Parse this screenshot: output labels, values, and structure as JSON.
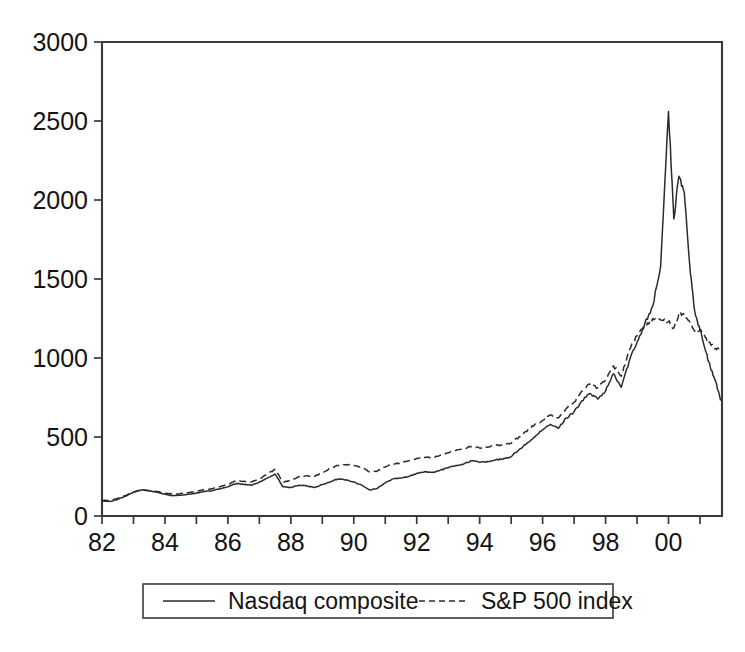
{
  "chart_data": {
    "type": "line",
    "title": "",
    "subtitle": "",
    "xlabel": "",
    "ylabel": "",
    "xlim": [
      1982.0,
      2001.7
    ],
    "ylim": [
      0,
      3000
    ],
    "grid": false,
    "legend_position": "bottom",
    "y_ticks": [
      0,
      500,
      1000,
      1500,
      2000,
      2500,
      3000
    ],
    "y_tick_labels": [
      "0",
      "500",
      "1000",
      "1500",
      "2000",
      "2500",
      "3000"
    ],
    "x_ticks": [
      1982,
      1983,
      1984,
      1985,
      1986,
      1987,
      1988,
      1989,
      1990,
      1991,
      1992,
      1993,
      1994,
      1995,
      1996,
      1997,
      1998,
      1999,
      2000,
      2001
    ],
    "x_tick_labels": [
      "82",
      "",
      "84",
      "",
      "86",
      "",
      "88",
      "",
      "90",
      "",
      "92",
      "",
      "94",
      "",
      "96",
      "",
      "98",
      "",
      "00",
      ""
    ],
    "x_labeled_ticks": [
      {
        "x": 1982,
        "label": "82"
      },
      {
        "x": 1984,
        "label": "84"
      },
      {
        "x": 1986,
        "label": "86"
      },
      {
        "x": 1988,
        "label": "88"
      },
      {
        "x": 1990,
        "label": "90"
      },
      {
        "x": 1992,
        "label": "92"
      },
      {
        "x": 1994,
        "label": "94"
      },
      {
        "x": 1996,
        "label": "96"
      },
      {
        "x": 1998,
        "label": "98"
      },
      {
        "x": 2000,
        "label": "00"
      }
    ],
    "series": [
      {
        "name": "Nasdaq composite",
        "style": "solid",
        "color": "#2b2b2b",
        "x": [
          1982.0,
          1982.25,
          1982.5,
          1982.75,
          1983.0,
          1983.25,
          1983.5,
          1983.75,
          1984.0,
          1984.25,
          1984.5,
          1984.75,
          1985.0,
          1985.25,
          1985.5,
          1985.75,
          1986.0,
          1986.25,
          1986.5,
          1986.75,
          1987.0,
          1987.25,
          1987.5,
          1987.75,
          1988.0,
          1988.25,
          1988.5,
          1988.75,
          1989.0,
          1989.25,
          1989.5,
          1989.75,
          1990.0,
          1990.25,
          1990.5,
          1990.75,
          1991.0,
          1991.25,
          1991.5,
          1991.75,
          1992.0,
          1992.25,
          1992.5,
          1992.75,
          1993.0,
          1993.25,
          1993.5,
          1993.75,
          1994.0,
          1994.25,
          1994.5,
          1994.75,
          1995.0,
          1995.25,
          1995.5,
          1995.75,
          1996.0,
          1996.25,
          1996.5,
          1996.75,
          1997.0,
          1997.25,
          1997.5,
          1997.75,
          1998.0,
          1998.25,
          1998.5,
          1998.75,
          1999.0,
          1999.25,
          1999.5,
          1999.75,
          2000.0,
          2000.17,
          2000.33,
          2000.5,
          2000.67,
          2000.83,
          2001.0,
          2001.17,
          2001.33,
          2001.5,
          2001.65
        ],
        "y": [
          95,
          92,
          105,
          125,
          150,
          165,
          160,
          150,
          138,
          128,
          132,
          138,
          145,
          155,
          160,
          172,
          185,
          205,
          200,
          195,
          215,
          240,
          265,
          185,
          180,
          195,
          190,
          180,
          200,
          215,
          235,
          230,
          215,
          195,
          165,
          175,
          210,
          235,
          240,
          250,
          270,
          280,
          275,
          290,
          305,
          320,
          330,
          350,
          340,
          345,
          355,
          360,
          375,
          420,
          460,
          500,
          545,
          580,
          555,
          620,
          660,
          730,
          775,
          740,
          790,
          900,
          815,
          980,
          1100,
          1220,
          1330,
          1580,
          2560,
          1880,
          2150,
          2050,
          1600,
          1300,
          1180,
          1050,
          940,
          850,
          735
        ]
      },
      {
        "name": "S&P 500 index",
        "style": "dashed",
        "color": "#2b2b2b",
        "x": [
          1982.0,
          1982.25,
          1982.5,
          1982.75,
          1983.0,
          1983.25,
          1983.5,
          1983.75,
          1984.0,
          1984.25,
          1984.5,
          1984.75,
          1985.0,
          1985.25,
          1985.5,
          1985.75,
          1986.0,
          1986.25,
          1986.5,
          1986.75,
          1987.0,
          1987.25,
          1987.5,
          1987.75,
          1988.0,
          1988.25,
          1988.5,
          1988.75,
          1989.0,
          1989.25,
          1989.5,
          1989.75,
          1990.0,
          1990.25,
          1990.5,
          1990.75,
          1991.0,
          1991.25,
          1991.5,
          1991.75,
          1992.0,
          1992.25,
          1992.5,
          1992.75,
          1993.0,
          1993.25,
          1993.5,
          1993.75,
          1994.0,
          1994.25,
          1994.5,
          1994.75,
          1995.0,
          1995.25,
          1995.5,
          1995.75,
          1996.0,
          1996.25,
          1996.5,
          1996.75,
          1997.0,
          1997.25,
          1997.5,
          1997.75,
          1998.0,
          1998.25,
          1998.5,
          1998.75,
          1999.0,
          1999.25,
          1999.5,
          1999.75,
          2000.0,
          2000.17,
          2000.33,
          2000.5,
          2000.67,
          2000.83,
          2001.0,
          2001.17,
          2001.33,
          2001.5,
          2001.65
        ],
        "y": [
          100,
          98,
          112,
          130,
          152,
          165,
          162,
          155,
          145,
          138,
          142,
          148,
          155,
          168,
          172,
          185,
          200,
          222,
          220,
          215,
          235,
          265,
          295,
          215,
          225,
          248,
          255,
          250,
          275,
          300,
          320,
          325,
          320,
          305,
          280,
          285,
          310,
          330,
          335,
          350,
          365,
          370,
          372,
          385,
          400,
          415,
          425,
          440,
          430,
          435,
          445,
          450,
          460,
          500,
          535,
          580,
          605,
          640,
          620,
          680,
          720,
          790,
          835,
          810,
          860,
          950,
          885,
          1050,
          1140,
          1200,
          1250,
          1240,
          1230,
          1190,
          1280,
          1270,
          1230,
          1170,
          1180,
          1130,
          1090,
          1060,
          1050
        ]
      }
    ]
  },
  "legend": {
    "items": [
      {
        "label": "Nasdaq composite",
        "style": "solid"
      },
      {
        "label": "S&P 500 index",
        "style": "dashed"
      }
    ]
  }
}
